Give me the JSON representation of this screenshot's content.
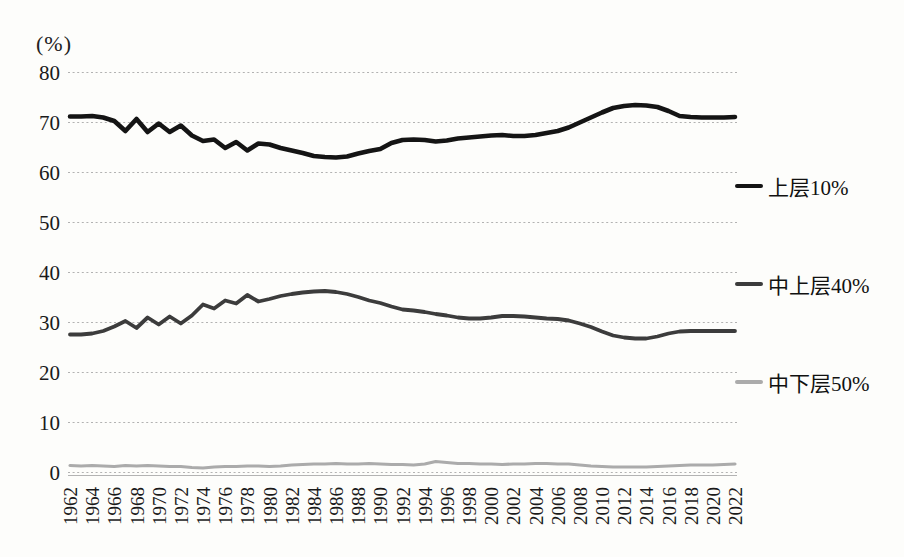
{
  "chart_data": {
    "type": "line",
    "unit_label": "(%)",
    "x": [
      1962,
      1963,
      1964,
      1965,
      1966,
      1967,
      1968,
      1969,
      1970,
      1971,
      1972,
      1973,
      1974,
      1975,
      1976,
      1977,
      1978,
      1979,
      1980,
      1981,
      1982,
      1983,
      1984,
      1985,
      1986,
      1987,
      1988,
      1989,
      1990,
      1991,
      1992,
      1993,
      1994,
      1995,
      1996,
      1997,
      1998,
      1999,
      2000,
      2001,
      2002,
      2003,
      2004,
      2005,
      2006,
      2007,
      2008,
      2009,
      2010,
      2011,
      2012,
      2013,
      2014,
      2015,
      2016,
      2017,
      2018,
      2019,
      2020,
      2021,
      2022
    ],
    "x_tick_labels": [
      "1962",
      "1964",
      "1966",
      "1968",
      "1970",
      "1972",
      "1974",
      "1976",
      "1978",
      "1980",
      "1982",
      "1984",
      "1986",
      "1988",
      "1990",
      "1992",
      "1994",
      "1996",
      "1998",
      "2000",
      "2002",
      "2004",
      "2006",
      "2008",
      "2010",
      "2012",
      "2014",
      "2016",
      "2018",
      "2020",
      "2022"
    ],
    "y_ticks": [
      0,
      10,
      20,
      30,
      40,
      50,
      60,
      70,
      80
    ],
    "ylim": [
      0,
      80
    ],
    "grid": "horizontal-dotted",
    "legend_position": "right",
    "gridline_color": "#a9a9a9",
    "axis_line_color": "#b3b3b3",
    "text_color": "#1a1a1a",
    "series": [
      {
        "id": "top10",
        "name": "上层10%",
        "color": "#141414",
        "stroke_width": 4.6,
        "values": [
          71.2,
          71.2,
          71.3,
          71.0,
          70.3,
          68.3,
          70.7,
          68.1,
          69.8,
          68.1,
          69.4,
          67.4,
          66.3,
          66.6,
          64.9,
          66.1,
          64.4,
          65.8,
          65.6,
          64.9,
          64.4,
          63.9,
          63.3,
          63.1,
          63.0,
          63.2,
          63.8,
          64.3,
          64.7,
          65.9,
          66.5,
          66.6,
          66.5,
          66.2,
          66.4,
          66.8,
          67.0,
          67.2,
          67.4,
          67.5,
          67.3,
          67.3,
          67.5,
          67.9,
          68.3,
          69.0,
          70.0,
          71.0,
          72.0,
          72.9,
          73.3,
          73.5,
          73.4,
          73.1,
          72.3,
          71.3,
          71.1,
          71.0,
          71.0,
          71.0,
          71.1
        ]
      },
      {
        "id": "middle40",
        "name": "中上层40%",
        "color": "#3c3c3c",
        "stroke_width": 3.8,
        "values": [
          27.6,
          27.6,
          27.8,
          28.3,
          29.2,
          30.3,
          28.9,
          31.0,
          29.6,
          31.2,
          29.8,
          31.4,
          33.6,
          32.8,
          34.4,
          33.8,
          35.5,
          34.2,
          34.7,
          35.3,
          35.7,
          36.0,
          36.2,
          36.3,
          36.1,
          35.7,
          35.1,
          34.4,
          33.9,
          33.2,
          32.6,
          32.4,
          32.1,
          31.7,
          31.4,
          31.0,
          30.8,
          30.8,
          31.0,
          31.3,
          31.3,
          31.2,
          31.0,
          30.8,
          30.7,
          30.4,
          29.8,
          29.1,
          28.2,
          27.4,
          27.0,
          26.8,
          26.8,
          27.2,
          27.8,
          28.2,
          28.3,
          28.3,
          28.3,
          28.3,
          28.3
        ]
      },
      {
        "id": "bottom50",
        "name": "中下层50%",
        "color": "#ababab",
        "stroke_width": 3.2,
        "values": [
          1.4,
          1.3,
          1.4,
          1.3,
          1.2,
          1.4,
          1.3,
          1.4,
          1.3,
          1.2,
          1.2,
          1.0,
          0.9,
          1.1,
          1.2,
          1.2,
          1.3,
          1.3,
          1.2,
          1.3,
          1.5,
          1.6,
          1.7,
          1.7,
          1.8,
          1.7,
          1.7,
          1.8,
          1.7,
          1.6,
          1.6,
          1.5,
          1.7,
          2.2,
          2.0,
          1.8,
          1.8,
          1.7,
          1.7,
          1.6,
          1.7,
          1.7,
          1.8,
          1.8,
          1.7,
          1.7,
          1.5,
          1.3,
          1.2,
          1.1,
          1.1,
          1.1,
          1.1,
          1.2,
          1.3,
          1.4,
          1.5,
          1.5,
          1.5,
          1.6,
          1.7
        ]
      }
    ]
  }
}
